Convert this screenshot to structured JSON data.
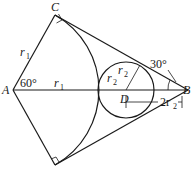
{
  "diagram": {
    "points": {
      "A": {
        "label": "A",
        "x": 13,
        "y": 90
      },
      "B": {
        "label": "B",
        "x": 188,
        "y": 90
      },
      "C": {
        "label": "C",
        "x": 55,
        "y": 15
      },
      "E": {
        "label": "",
        "x": 55,
        "y": 165
      },
      "D": {
        "label": "D",
        "x": 126,
        "y": 90
      }
    },
    "labels": {
      "A": "A",
      "B": "B",
      "C": "C",
      "D": "D",
      "r1_side": "r",
      "r1_side_sub": "1",
      "r1_axis": "r",
      "r1_axis_sub": "1",
      "r2_left": "r",
      "r2_left_sub": "2",
      "r2_right": "r",
      "r2_right_sub": "2",
      "angle_A": "60°",
      "angle_B": "30°",
      "dim_2r2": "2r",
      "dim_2r2_sub": "2"
    },
    "circle_D_radius": 28,
    "arc_A_radius": 85
  }
}
